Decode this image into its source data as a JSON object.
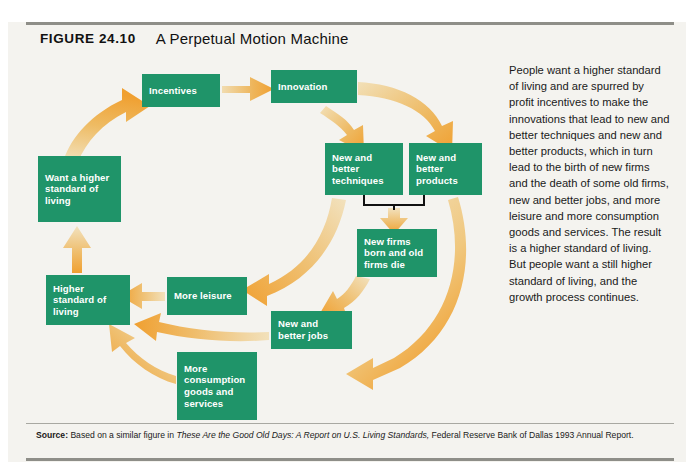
{
  "figure": {
    "label": "FIGURE  24.10",
    "title": "A Perpetual Motion Machine"
  },
  "caption": {
    "text": "People want a higher standard of living and are spurred by profit incentives to make the innovations that lead to new and better techniques and new and better products, which in turn lead to the birth of new firms and the death of some old firms, new and better jobs, and more leisure and more consumption goods and services. The result is a higher standard of living. But people want a still higher standard of living, and the growth process continues."
  },
  "source": {
    "lead": "Source:",
    "before_title": " Based on a similar figure in ",
    "title": "These Are the Good Old Days: A Report on U.S. Living Standards,",
    "after_title": " Federal Reserve Bank of Dallas 1993 Annual Report."
  },
  "colors": {
    "node_green": "#1f9469",
    "arrow_orange": "#f0a031",
    "arrow_pale": "#efd9a6",
    "background": "#f4f3ef",
    "rule": "#8e8e88",
    "node_text": "#ffffff",
    "bracket": "#111111"
  },
  "diagram": {
    "type": "cycle-flow-diagram",
    "nodes": [
      {
        "id": "incentives",
        "label": "Incentives"
      },
      {
        "id": "innovation",
        "label": "Innovation"
      },
      {
        "id": "techniques",
        "label": "New and better techniques"
      },
      {
        "id": "products",
        "label": "New and better products"
      },
      {
        "id": "newfirms",
        "label": "New firms born and old firms die"
      },
      {
        "id": "newjobs",
        "label": "New and better jobs"
      },
      {
        "id": "moreleisure",
        "label": "More leisure"
      },
      {
        "id": "consumption",
        "label": "More consumption goods and services"
      },
      {
        "id": "higherstd",
        "label": "Higher standard of living"
      },
      {
        "id": "wanthigher",
        "label": "Want a higher standard of living"
      }
    ],
    "edges": [
      {
        "from": "wanthigher",
        "to": "incentives"
      },
      {
        "from": "incentives",
        "to": "innovation"
      },
      {
        "from": "innovation",
        "to": "techniques"
      },
      {
        "from": "innovation",
        "to": "products"
      },
      {
        "from": "techniques",
        "to": "newfirms"
      },
      {
        "from": "products",
        "to": "newfirms"
      },
      {
        "from": "techniques",
        "to": "moreleisure"
      },
      {
        "from": "newfirms",
        "to": "newjobs"
      },
      {
        "from": "products",
        "to": "consumption"
      },
      {
        "from": "moreleisure",
        "to": "higherstd"
      },
      {
        "from": "newjobs",
        "to": "higherstd"
      },
      {
        "from": "consumption",
        "to": "higherstd"
      },
      {
        "from": "higherstd",
        "to": "wanthigher"
      }
    ]
  }
}
